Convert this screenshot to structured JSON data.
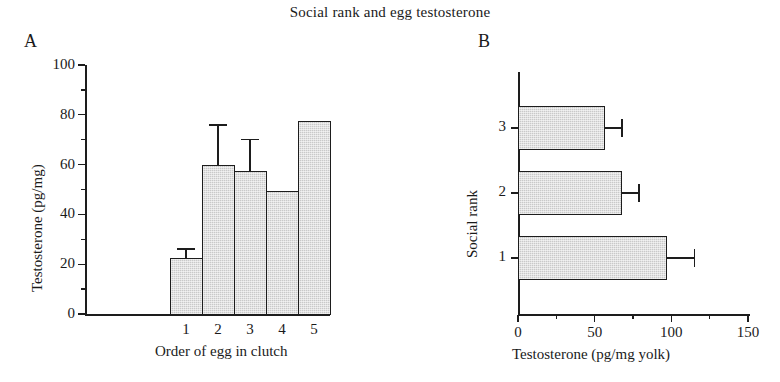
{
  "figure": {
    "title": "Social rank and egg testosterone"
  },
  "panels": {
    "a": {
      "letter": "A",
      "ylabel": "Testosterone (pg/mg)",
      "xlabel": "Order of egg in clutch",
      "ytick_labels": [
        "0",
        "20",
        "40",
        "60",
        "80",
        "100"
      ],
      "xtick_labels": [
        "1",
        "2",
        "3",
        "4",
        "5"
      ]
    },
    "b": {
      "letter": "B",
      "ylabel": "Social rank",
      "xlabel": "Testosterone (pg/mg yolk)",
      "ytick_labels": [
        "1",
        "2",
        "3"
      ],
      "xtick_labels": [
        "0",
        "50",
        "100",
        "150"
      ]
    }
  },
  "chart_data": [
    {
      "id": "panel-a",
      "type": "bar",
      "orientation": "vertical",
      "title": "A",
      "xlabel": "Order of egg in clutch",
      "ylabel": "Testosterone (pg/mg)",
      "categories": [
        "1",
        "2",
        "3",
        "4",
        "5"
      ],
      "values": [
        22.5,
        60.0,
        57.5,
        49.5,
        77.5
      ],
      "errors": [
        3.5,
        16.0,
        12.5,
        null,
        null
      ],
      "error_type": "upper-only",
      "ylim": [
        0,
        100
      ],
      "yticks": [
        0,
        20,
        40,
        60,
        80,
        100
      ],
      "yminorticks": [
        10,
        30,
        50,
        70,
        90
      ],
      "grid": false,
      "legend": false,
      "bar_fill": "#c9c9c9",
      "bar_edge": "#1d1d1d",
      "bars_adjacent": true
    },
    {
      "id": "panel-b",
      "type": "bar",
      "orientation": "horizontal",
      "title": "B",
      "xlabel": "Testosterone (pg/mg yolk)",
      "ylabel": "Social rank",
      "categories": [
        "1",
        "2",
        "3"
      ],
      "values": [
        97.0,
        68.0,
        57.0
      ],
      "errors": [
        18.0,
        11.0,
        11.0
      ],
      "error_type": "upper-only",
      "xlim": [
        0,
        150
      ],
      "xticks": [
        0,
        50,
        100,
        150
      ],
      "xminorticks": [
        25,
        75,
        125
      ],
      "grid": false,
      "legend": false,
      "bar_fill": "#c9c9c9",
      "bar_edge": "#1d1d1d",
      "bars_adjacent": false
    }
  ]
}
